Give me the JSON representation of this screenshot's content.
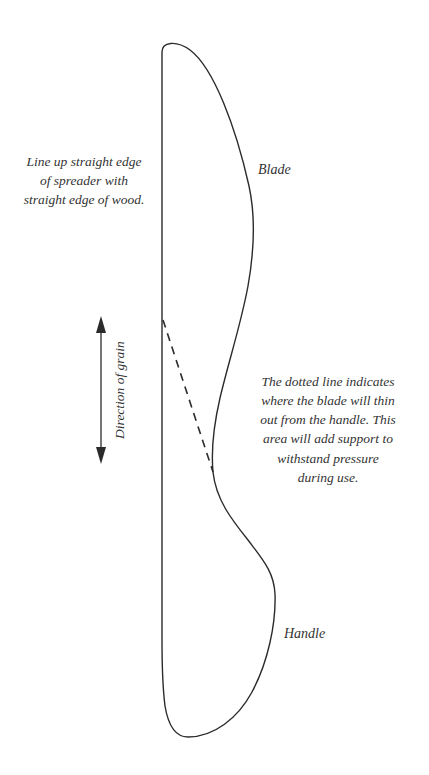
{
  "diagram": {
    "background_color": "#ffffff",
    "outline_color": "#2b2b2b",
    "text_color": "#333333"
  },
  "annotations": {
    "align_instruction": "Line up straight edge\nof spreader with\nstraight edge of wood.",
    "dotted_line_note": "The dotted line indicates\nwhere the blade will thin\nout from the handle. This\narea will add support to\nwithstand pressure\nduring use."
  },
  "labels": {
    "blade": "Blade",
    "handle": "Handle",
    "grain_direction": "Direction of grain"
  },
  "shapes": {
    "outline_name": "spreader-outline",
    "dashed_line_name": "blade-thinning-dashed-line",
    "grain_arrow_name": "grain-direction-arrow"
  }
}
